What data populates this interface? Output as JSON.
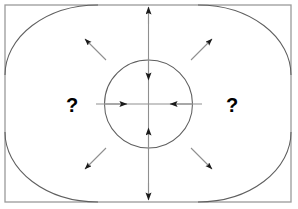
{
  "diagram": {
    "background_color": "#ffffff",
    "line_color": "#666666",
    "arrow_color": "#1a1a1a",
    "border_color": "#9a9a9a",
    "text_color": "#000000",
    "border": {
      "x": 5,
      "y": 5,
      "width": 286,
      "height": 197,
      "stroke_width": 1.3
    },
    "center_circle": {
      "cx": 148.5,
      "cy": 104,
      "r": 44,
      "stroke_width": 1.1
    },
    "corner_arcs": [
      {
        "name": "arc-top-left",
        "corner": "top-left",
        "rx": 93,
        "ry": 70
      },
      {
        "name": "arc-top-right",
        "corner": "top-right",
        "rx": 93,
        "ry": 70
      },
      {
        "name": "arc-bottom-left",
        "corner": "bottom-left",
        "rx": 93,
        "ry": 70
      },
      {
        "name": "arc-bottom-right",
        "corner": "bottom-right",
        "rx": 93,
        "ry": 70
      }
    ],
    "axis_lines": [
      {
        "name": "vertical-axis",
        "orientation": "vertical",
        "x1": 148.5,
        "y1": 6,
        "x2": 148.5,
        "y2": 201
      },
      {
        "name": "horizontal-axis",
        "orientation": "horizontal",
        "x1": 96,
        "y1": 104,
        "x2": 202,
        "y2": 104
      }
    ],
    "inward_arrows": [
      {
        "name": "arrow-inward-top",
        "direction": "down",
        "label": "inward from top"
      },
      {
        "name": "arrow-inward-bottom",
        "direction": "up",
        "label": "inward from bottom"
      },
      {
        "name": "arrow-inward-left",
        "direction": "right",
        "label": "inward from left"
      },
      {
        "name": "arrow-inward-right",
        "direction": "left",
        "label": "inward from right"
      }
    ],
    "outward_arrows": [
      {
        "name": "arrow-outward-top",
        "direction": "up",
        "label": "outward at top edge"
      },
      {
        "name": "arrow-outward-bottom",
        "direction": "down",
        "label": "outward at bottom edge"
      }
    ],
    "corner_arrows": [
      {
        "name": "arrow-corner-top-left",
        "direction": "up-left",
        "label": "toward top-left corner"
      },
      {
        "name": "arrow-corner-top-right",
        "direction": "up-right",
        "label": "toward top-right corner"
      },
      {
        "name": "arrow-corner-bottom-left",
        "direction": "down-left",
        "label": "toward bottom-left corner"
      },
      {
        "name": "arrow-corner-bottom-right",
        "direction": "down-right",
        "label": "toward bottom-right corner"
      }
    ],
    "labels": {
      "left_question": "?",
      "right_question": "?",
      "left_question_x": 72,
      "left_question_y": 112,
      "right_question_x": 232,
      "right_question_y": 112
    }
  }
}
